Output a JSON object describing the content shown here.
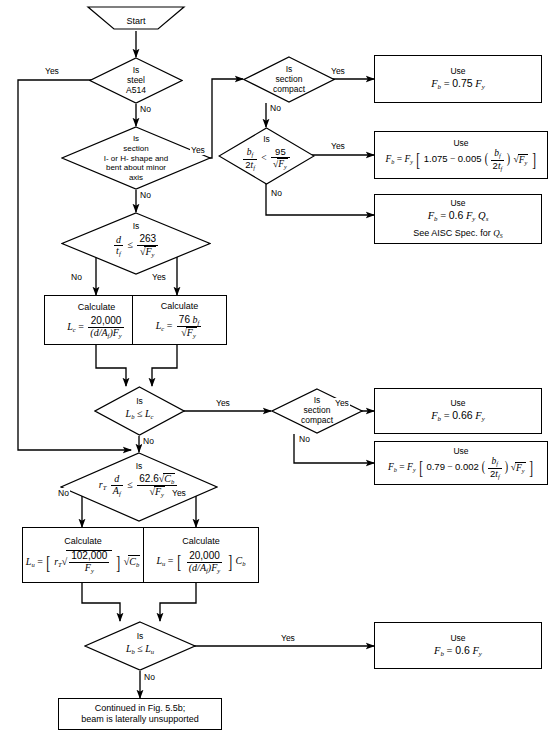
{
  "figure": {
    "stroke_color": "#000000",
    "background_color": "#ffffff"
  },
  "nodes": {
    "start": {
      "type": "terminator",
      "label": "Start"
    },
    "d1": {
      "type": "decision",
      "line1": "Is",
      "line2": "steel",
      "line3": "A514"
    },
    "d2": {
      "type": "decision",
      "line1": "Is",
      "line2": "section",
      "line3": "I- or H- shape and",
      "line4": "bent about minor",
      "line5": "axis"
    },
    "d3": {
      "type": "decision",
      "prefix": "Is",
      "formula": "d / t_f  ≤  263 / √F_y"
    },
    "d4": {
      "type": "decision",
      "line1": "Is",
      "line2": "section",
      "line3": "compact"
    },
    "d5": {
      "type": "decision",
      "prefix": "Is",
      "formula": "b_f / 2t_f  <  95 / √F_y"
    },
    "d6": {
      "type": "decision",
      "prefix": "Is",
      "formula": "L_b ≤ L_c"
    },
    "d7": {
      "type": "decision",
      "line1": "Is",
      "line2": "section",
      "line3": "compact"
    },
    "d8": {
      "type": "decision",
      "prefix": "Is",
      "formula": "r_T d/A_f  ≤  62.6√C_b / √F_y"
    },
    "d9": {
      "type": "decision",
      "prefix": "Is",
      "formula": "L_b ≤ L_u"
    },
    "p1": {
      "type": "process",
      "title": "Calculate",
      "formula": "L_c = 20,000 / ((d/A_f)F_y)"
    },
    "p2": {
      "type": "process",
      "title": "Calculate",
      "formula": "L_c = 76 b_f / √F_y"
    },
    "p3": {
      "type": "process",
      "title": "Calculate",
      "formula": "L_u = [ r_T √(102,000/F_y) ] √C_b"
    },
    "p4": {
      "type": "process",
      "title": "Calculate",
      "formula": "L_u = [ 20,000 / ((d/A_f)F_y) ] C_b"
    },
    "r1": {
      "type": "result",
      "title": "Use",
      "formula": "F_b = 0.75 F_y"
    },
    "r2": {
      "type": "result",
      "title": "Use",
      "formula": "F_b = F_y [ 1.075 − 0.005 (b_f/2t_f) √F_y ]"
    },
    "r3": {
      "type": "result",
      "title": "Use",
      "formula": "F_b = 0.6 F_y Q_s",
      "note": "See AISC Spec. for Q_S"
    },
    "r4": {
      "type": "result",
      "title": "Use",
      "formula": "F_b = 0.66 F_y"
    },
    "r5": {
      "type": "result",
      "title": "Use",
      "formula": "F_b = F_y [ 0.79 − 0.002 (b_f/2t_f) √F_y ]"
    },
    "r6": {
      "type": "result",
      "title": "Use",
      "formula": "F_b = 0.6 F_y"
    },
    "end": {
      "type": "terminator-box",
      "line1": "Continued in Fig. 5.5b;",
      "line2": "beam is laterally unsupported"
    }
  },
  "edge_labels": {
    "d1_yes": "Yes",
    "d1_no": "No",
    "d2_yes": "Yes",
    "d2_no": "No",
    "d3_yes": "Yes",
    "d3_no": "No",
    "d4_yes": "Yes",
    "d4_no": "No",
    "d5_yes": "Yes",
    "d5_no": "No",
    "d6_yes": "Yes",
    "d6_no": "No",
    "d7_yes": "Yes",
    "d7_no": "No",
    "d8_yes": "Yes",
    "d8_no": "No",
    "d9_yes": "Yes",
    "d9_no": "No"
  },
  "text": {
    "start": "Start",
    "calculate": "Calculate",
    "use": "Use",
    "is": "Is",
    "see_aisc": "See AISC Spec. for",
    "cont1": "Continued in Fig. 5.5b;",
    "cont2": "beam is laterally unsupported",
    "steel_l1": "Is",
    "steel_l2": "steel",
    "steel_l3": "A514",
    "sect_l1": "Is",
    "sect_l2": "section",
    "sect_l3": "I- or H- shape and",
    "sect_l4": "bent about minor",
    "sect_l5": "axis",
    "compact_l1": "Is",
    "compact_l2": "section",
    "compact_l3": "compact"
  }
}
